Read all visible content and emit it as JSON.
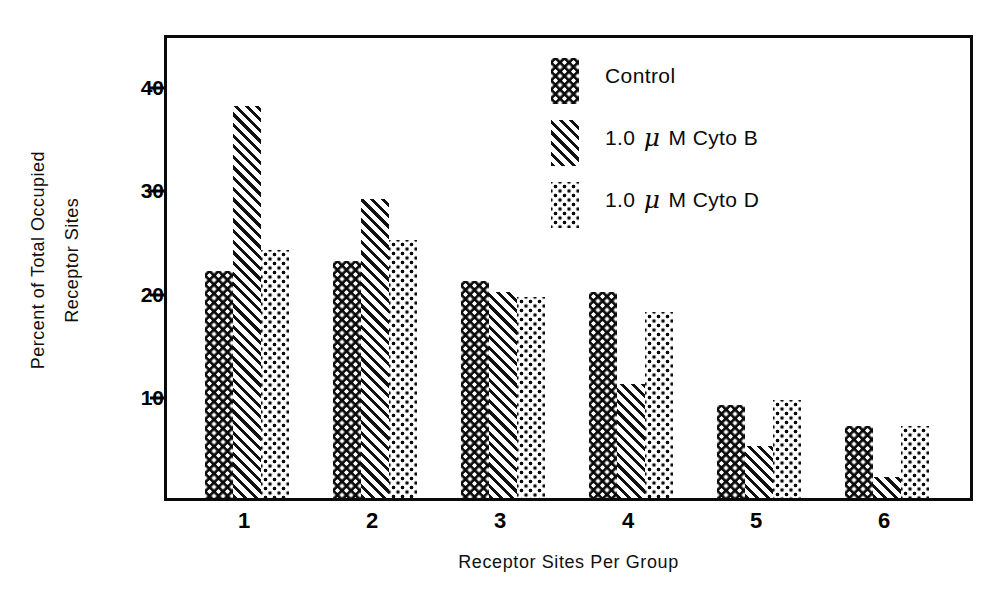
{
  "chart_data": {
    "type": "bar",
    "title": "",
    "xlabel": "Receptor  Sites  Per  Group",
    "ylabel_line1": "Percent of  Total  Occupied",
    "ylabel_line2": "Receptor  Sites",
    "categories": [
      "1",
      "2",
      "3",
      "4",
      "5",
      "6"
    ],
    "yticks": [
      10,
      20,
      30,
      40
    ],
    "ytick_labels": [
      "10",
      "20",
      "30",
      "40"
    ],
    "ylim": [
      0,
      45
    ],
    "grid": false,
    "legend_position": "inside-top-center",
    "series": [
      {
        "name": "Control",
        "pattern": "black-with-white-dots",
        "values": [
          22,
          23,
          21,
          20,
          9,
          7
        ]
      },
      {
        "name": "1.0 μM Cyto B",
        "label_prefix": "1.0",
        "label_mu": "μ",
        "label_suffix": "M  Cyto  B",
        "pattern": "diagonal-hatch",
        "values": [
          38,
          29,
          20,
          11,
          5,
          2
        ]
      },
      {
        "name": "1.0 μM Cyto D",
        "label_prefix": "1.0",
        "label_mu": "μ",
        "label_suffix": "M  Cyto  D",
        "pattern": "white-with-black-dots",
        "values": [
          24,
          25,
          19.5,
          18,
          9.5,
          7
        ]
      }
    ],
    "colors": {
      "axis": "#0a0a0a",
      "text": "#0a0a0a",
      "background": "#ffffff"
    }
  },
  "legend": {
    "items": [
      {
        "label": "Control",
        "has_mu": false
      },
      {
        "label": "1.0 μ M  Cyto  B",
        "has_mu": true,
        "pre": "1.0",
        "post": "M  Cyto  B"
      },
      {
        "label": "1.0 μ M  Cyto  D",
        "has_mu": true,
        "pre": "1.0",
        "post": "M  Cyto  D"
      }
    ]
  }
}
